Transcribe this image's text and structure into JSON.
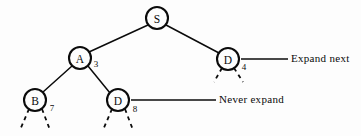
{
  "figure": {
    "background_color": "#fdfdfd",
    "ink_color": "#0b0b0b",
    "width": 361,
    "height": 136
  },
  "nodes": [
    {
      "id": "S",
      "label": "S",
      "cx": 157,
      "cy": 18,
      "r": 11,
      "cost": "",
      "cost_x": 0,
      "cost_y": 0,
      "has_dashed_children": false
    },
    {
      "id": "A",
      "label": "A",
      "cx": 80,
      "cy": 58,
      "r": 11,
      "cost": "3",
      "cost_x": 96,
      "cost_y": 64,
      "has_dashed_children": false
    },
    {
      "id": "D1",
      "label": "D",
      "cx": 228,
      "cy": 59,
      "r": 11,
      "cost": "4",
      "cost_x": 244,
      "cost_y": 67,
      "has_dashed_children": true
    },
    {
      "id": "B",
      "label": "B",
      "cx": 35,
      "cy": 100,
      "r": 11,
      "cost": "7",
      "cost_x": 52,
      "cost_y": 108,
      "has_dashed_children": true
    },
    {
      "id": "D2",
      "label": "D",
      "cx": 118,
      "cy": 100,
      "r": 11,
      "cost": "8",
      "cost_x": 135,
      "cost_y": 109,
      "has_dashed_children": true
    }
  ],
  "edges": [
    {
      "from": "S",
      "to": "A",
      "x1": 148,
      "y1": 25,
      "x2": 89,
      "y2": 52
    },
    {
      "from": "S",
      "to": "D1",
      "x1": 166,
      "y1": 25,
      "x2": 219,
      "y2": 53
    },
    {
      "from": "A",
      "to": "B",
      "x1": 72,
      "y1": 66,
      "x2": 43,
      "y2": 92
    },
    {
      "from": "A",
      "to": "D2",
      "x1": 88,
      "y1": 66,
      "x2": 110,
      "y2": 93
    }
  ],
  "dashed_stubs": [
    {
      "parent": "D1",
      "x1": 222,
      "y1": 68,
      "x2": 214,
      "y2": 82
    },
    {
      "parent": "D1",
      "x1": 234,
      "y1": 68,
      "x2": 243,
      "y2": 82
    },
    {
      "parent": "B",
      "x1": 29,
      "y1": 109,
      "x2": 20,
      "y2": 130
    },
    {
      "parent": "B",
      "x1": 42,
      "y1": 109,
      "x2": 50,
      "y2": 130
    },
    {
      "parent": "D2",
      "x1": 112,
      "y1": 109,
      "x2": 103,
      "y2": 130
    },
    {
      "parent": "D2",
      "x1": 125,
      "y1": 109,
      "x2": 133,
      "y2": 130
    }
  ],
  "annotations": [
    {
      "id": "expand-next",
      "text": "Expand next",
      "leader": {
        "x1": 241,
        "y1": 59,
        "x2": 288,
        "y2": 59
      }
    },
    {
      "id": "never-expand",
      "text": "Never expand",
      "leader": {
        "x1": 131,
        "y1": 100,
        "x2": 216,
        "y2": 100
      }
    }
  ]
}
